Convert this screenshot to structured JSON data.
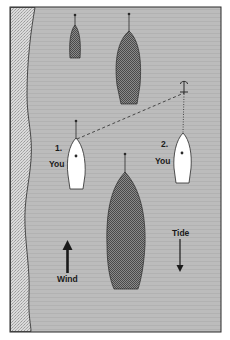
{
  "diagram": {
    "colors": {
      "water": "#b9b9b9",
      "shore": "#d4d4d4",
      "moored_boat": "#6e6e6e",
      "your_boat": "#ffffff",
      "outline": "#2a2a2a"
    },
    "labels": {
      "boat1_number": "1.",
      "boat1_name": "You",
      "boat2_number": "2.",
      "boat2_name": "You",
      "wind": "Wind",
      "tide": "Tide"
    },
    "elements": {
      "moored_boats": 3,
      "anchor": "anchor-icon",
      "wind_direction": "up",
      "tide_direction": "down"
    }
  }
}
